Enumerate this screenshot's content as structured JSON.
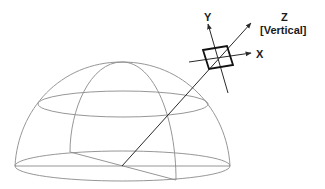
{
  "diagram": {
    "labels": {
      "y_axis": "Y",
      "z_axis": "Z",
      "z_axis_note": "[Vertical]",
      "x_axis": "X"
    },
    "colors": {
      "dome_wireframe": "#8a8a8a",
      "axes": "#2a2a2a",
      "sensor_box": "#111111",
      "text": "#1a1a1a",
      "background": "#ffffff"
    }
  }
}
